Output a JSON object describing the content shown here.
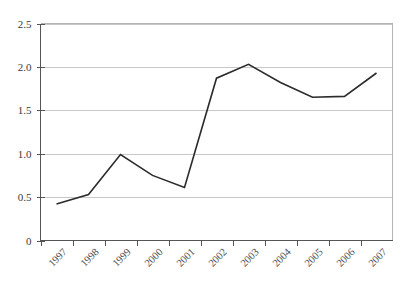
{
  "chart_data": {
    "type": "line",
    "title": "",
    "subtitle": "",
    "xlabel": "",
    "ylabel": "",
    "categories": [
      "1997",
      "1998",
      "1999",
      "2000",
      "2001",
      "2002",
      "2003",
      "2004",
      "2005",
      "2006",
      "2007"
    ],
    "values": [
      0.42,
      0.53,
      0.99,
      0.75,
      0.61,
      1.87,
      2.03,
      1.82,
      1.65,
      1.66,
      1.93
    ],
    "series": [
      {
        "name": "",
        "values": [
          0.42,
          0.53,
          0.99,
          0.75,
          0.61,
          1.87,
          2.03,
          1.82,
          1.65,
          1.66,
          1.93
        ]
      }
    ],
    "ylim": [
      0,
      2.5
    ],
    "ytick_labels": [
      "0",
      "0.5",
      "1.0",
      "1.5",
      "2.0",
      "2.5"
    ],
    "ytick_values": [
      0,
      0.5,
      1.0,
      1.5,
      2.0,
      2.5
    ],
    "grid": true,
    "grid_axis": "y",
    "legend": false,
    "legend_position": "none",
    "xtick_label_rotation": 45,
    "line_color": "#2b2b2b",
    "gridline_color": "#c8c8c8",
    "axis_color": "#555555",
    "background_color": "#ffffff",
    "annotations": []
  }
}
